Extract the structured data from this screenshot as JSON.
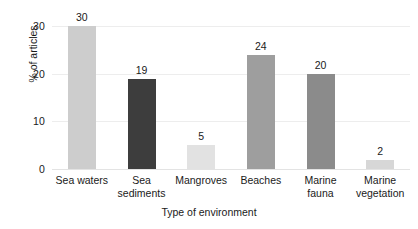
{
  "chart_data": {
    "type": "bar",
    "title": "",
    "subtitle": "",
    "xlabel": "Type of environment",
    "ylabel": "% of articles",
    "categories": [
      "Sea waters",
      "Sea sediments",
      "Mangroves",
      "Beaches",
      "Marine fauna",
      "Marine vegetation"
    ],
    "category_lines": [
      [
        "Sea waters"
      ],
      [
        "Sea",
        "sediments"
      ],
      [
        "Mangroves"
      ],
      [
        "Beaches"
      ],
      [
        "Marine",
        "fauna"
      ],
      [
        "Marine",
        "vegetation"
      ]
    ],
    "values": [
      30,
      19,
      5,
      24,
      20,
      2
    ],
    "value_labels": [
      "30",
      "19",
      "5",
      "24",
      "20",
      "2"
    ],
    "bar_colors": [
      "#cdcdcd",
      "#3d3d3d",
      "#e2e2e2",
      "#9e9e9e",
      "#8b8b8b",
      "#d7d7d7"
    ],
    "ylim": [
      0,
      33
    ],
    "yticks": [
      0,
      10,
      20,
      30
    ],
    "ytick_labels": [
      "0",
      "10",
      "20",
      "30"
    ],
    "grid": true,
    "grid_color": "#ededed",
    "legend": "none",
    "text_color": "#1a1a1a",
    "background": "#ffffff"
  }
}
